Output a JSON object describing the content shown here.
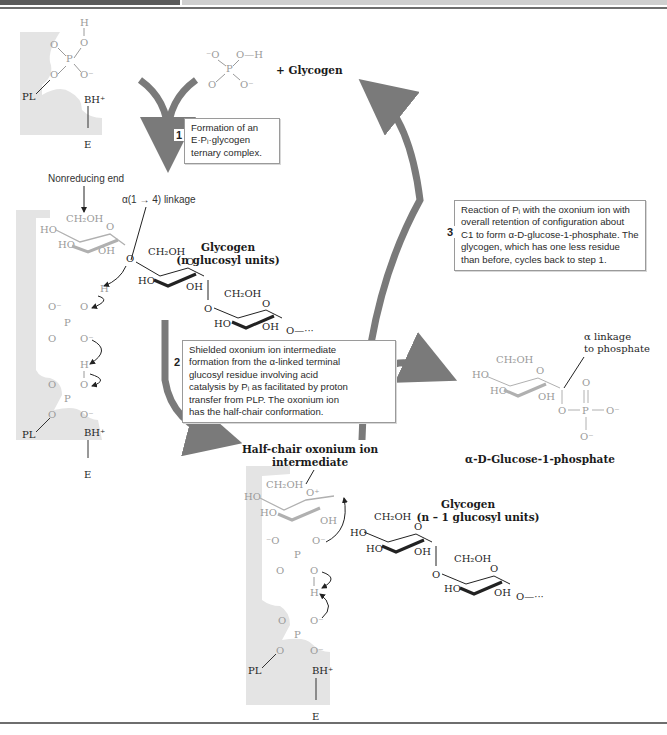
{
  "header": {
    "bar_dark_color": "#5a5a5a",
    "bar_light_color": "#cfcfcf"
  },
  "enzyme": {
    "label": "E",
    "pl_label": "PL",
    "base_label": "BH⁺",
    "pocket_color": "#e4e4e4"
  },
  "reactants": {
    "phosphate": {
      "atoms": [
        "⁻O",
        "O—H",
        "P",
        "O",
        "O⁻"
      ]
    },
    "plus_glycogen": "+ Glycogen"
  },
  "steps": [
    {
      "number": "1",
      "lines": [
        "Formation of an",
        "E·Pᵢ·glycogen",
        "ternary complex."
      ]
    },
    {
      "number": "2",
      "lines": [
        "Shielded oxonium ion intermediate",
        "formation from the α-linked terminal",
        "glucosyl residue involving acid",
        "catalysis by Pᵢ as facilitated by proton",
        "transfer from PLP. The oxonium ion",
        "has the half-chair conformation."
      ]
    },
    {
      "number": "3",
      "lines": [
        "Reaction of Pᵢ with the oxonium ion with",
        "overall retention of configuration about",
        "C1 to form α-D-glucose-1-phosphate. The",
        "glycogen, which has one less residue",
        "than before, cycles back to step 1."
      ]
    }
  ],
  "annotations": {
    "nonreducing_end": "Nonreducing end",
    "linkage": "α(1 → 4) linkage",
    "glycogen_n_title": "Glycogen",
    "glycogen_n_sub": "(n glucosyl units)",
    "glycogen_n1_title": "Glycogen",
    "glycogen_n1_sub": "(n – 1 glucosyl units)",
    "half_chair_line1": "Half-chair oxonium ion",
    "half_chair_line2": "intermediate",
    "alpha_linkage_line1": "α linkage",
    "alpha_linkage_line2": "to phosphate",
    "product": "α-D-Glucose-1-phosphate"
  },
  "chem_labels": {
    "ch2oh": "CH₂OH",
    "ho": "HO",
    "oh": "OH",
    "o": "O",
    "o_minus": "O⁻",
    "minus_o": "⁻O",
    "p": "P",
    "h": "H",
    "chain": "O—···",
    "o_plus": "O⁺"
  },
  "colors": {
    "arrow": "#7a7a7a",
    "faded_chem": "#9a9a9a",
    "dark_chem": "#1f1f1f"
  }
}
